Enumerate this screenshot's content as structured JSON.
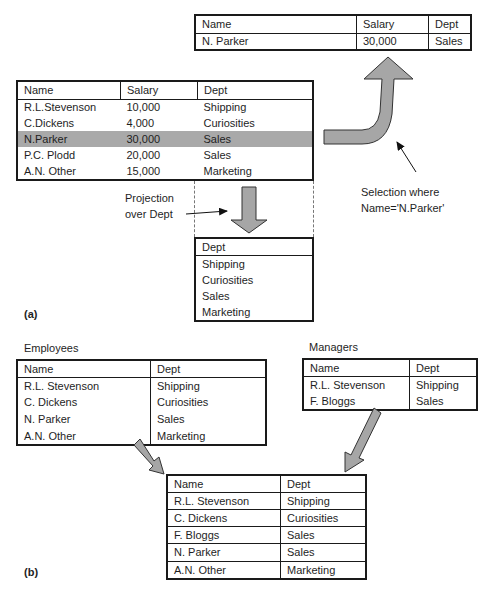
{
  "part_a": {
    "caption": "(a)",
    "source_table": {
      "headers": [
        "Name",
        "Salary",
        "Dept"
      ],
      "rows": [
        [
          "R.L.Stevenson",
          "10,000",
          "Shipping"
        ],
        [
          "C.Dickens",
          "4,000",
          "Curiosities"
        ],
        [
          "N.Parker",
          "30,000",
          "Sales"
        ],
        [
          "P.C. Plodd",
          "20,000",
          "Sales"
        ],
        [
          "A.N. Other",
          "15,000",
          "Marketing"
        ]
      ],
      "highlighted_row_index": 2,
      "highlight_color": "#a9a9a9"
    },
    "selection_result": {
      "headers": [
        "Name",
        "Salary",
        "Dept"
      ],
      "rows": [
        [
          "N. Parker",
          "30,000",
          "Sales"
        ]
      ]
    },
    "selection_label": {
      "line1": "Selection where",
      "line2": "Name='N.Parker'"
    },
    "projection_label": {
      "line1": "Projection",
      "line2": "over Dept"
    },
    "projection_result": {
      "headers": [
        "Dept"
      ],
      "rows": [
        [
          "Shipping"
        ],
        [
          "Curiosities"
        ],
        [
          "Sales"
        ],
        [
          "Marketing"
        ]
      ]
    },
    "arrow_color": "#a6a6a6"
  },
  "part_b": {
    "caption": "(b)",
    "employees": {
      "title": "Employees",
      "headers": [
        "Name",
        "Dept"
      ],
      "rows": [
        [
          "R.L. Stevenson",
          "Shipping"
        ],
        [
          "C. Dickens",
          "Curiosities"
        ],
        [
          "N. Parker",
          "Sales"
        ],
        [
          "A.N. Other",
          "Marketing"
        ]
      ]
    },
    "managers": {
      "title": "Managers",
      "headers": [
        "Name",
        "Dept"
      ],
      "rows": [
        [
          "R.L. Stevenson",
          "Shipping"
        ],
        [
          "F. Bloggs",
          "Sales"
        ]
      ]
    },
    "union_result": {
      "headers": [
        "Name",
        "Dept"
      ],
      "rows": [
        [
          "R.L. Stevenson",
          "Shipping"
        ],
        [
          "C. Dickens",
          "Curiosities"
        ],
        [
          "F. Bloggs",
          "Sales"
        ],
        [
          "N. Parker",
          "Sales"
        ],
        [
          "A.N. Other",
          "Marketing"
        ]
      ]
    }
  }
}
